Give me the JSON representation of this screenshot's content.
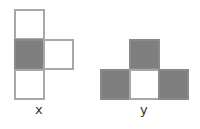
{
  "figure": {
    "shapes": [
      {
        "label": "x",
        "cells": [
          {
            "row": 0,
            "col": 0,
            "filled": false
          },
          {
            "row": 1,
            "col": 0,
            "filled": true
          },
          {
            "row": 1,
            "col": 1,
            "filled": false
          },
          {
            "row": 2,
            "col": 0,
            "filled": false
          }
        ]
      },
      {
        "label": "y",
        "cells": [
          {
            "row": 0,
            "col": 1,
            "filled": true
          },
          {
            "row": 1,
            "col": 0,
            "filled": true
          },
          {
            "row": 1,
            "col": 1,
            "filled": false
          },
          {
            "row": 1,
            "col": 2,
            "filled": true
          }
        ]
      }
    ],
    "colors": {
      "filled": "#7f7f7f",
      "border": "#a8a8a8",
      "empty": "#ffffff"
    }
  }
}
